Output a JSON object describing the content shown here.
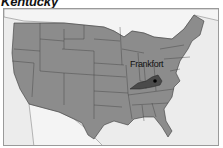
{
  "title": "Kentucky",
  "map": {
    "region": "United States",
    "highlighted_state": "Kentucky",
    "capital": {
      "label": "Frankfort"
    },
    "colors": {
      "background": "#ececec",
      "states": "#8c8c8c",
      "highlight": "#4a4a4a",
      "borders": "#3a3a3a",
      "neighbors": "#d8d8d8"
    }
  }
}
